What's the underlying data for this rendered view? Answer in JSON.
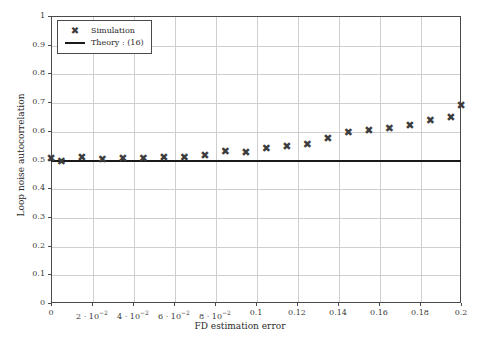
{
  "chart_data": {
    "type": "scatter",
    "title": "",
    "xlabel": "FD estimation error",
    "ylabel": "Loop noise autocorrelation",
    "xlim": [
      0,
      0.2
    ],
    "ylim": [
      0,
      1
    ],
    "grid": true,
    "legend_position": "top-left",
    "xticks": [
      {
        "value": 0,
        "label": "0"
      },
      {
        "value": 0.02,
        "label": "2 · 10",
        "exp": "−2"
      },
      {
        "value": 0.04,
        "label": "4 · 10",
        "exp": "−2"
      },
      {
        "value": 0.06,
        "label": "6 · 10",
        "exp": "−2"
      },
      {
        "value": 0.08,
        "label": "8 · 10",
        "exp": "−2"
      },
      {
        "value": 0.1,
        "label": "0.1",
        "exp": ""
      },
      {
        "value": 0.12,
        "label": "0.12",
        "exp": ""
      },
      {
        "value": 0.14,
        "label": "0.14",
        "exp": ""
      },
      {
        "value": 0.16,
        "label": "0.16",
        "exp": ""
      },
      {
        "value": 0.18,
        "label": "0.18",
        "exp": ""
      },
      {
        "value": 0.2,
        "label": "0.2",
        "exp": ""
      }
    ],
    "yticks": [
      {
        "value": 0,
        "label": "0"
      },
      {
        "value": 0.1,
        "label": "0.1"
      },
      {
        "value": 0.2,
        "label": "0.2"
      },
      {
        "value": 0.3,
        "label": "0.3"
      },
      {
        "value": 0.4,
        "label": "0.4"
      },
      {
        "value": 0.5,
        "label": "0.5"
      },
      {
        "value": 0.6,
        "label": "0.6"
      },
      {
        "value": 0.7,
        "label": "0.7"
      },
      {
        "value": 0.8,
        "label": "0.8"
      },
      {
        "value": 0.9,
        "label": "0.9"
      },
      {
        "value": 1,
        "label": "1"
      }
    ],
    "series": [
      {
        "name": "Simulation",
        "type": "scatter",
        "marker": "✖",
        "color": "#3d3d3d",
        "x": [
          0.0,
          0.005,
          0.015,
          0.025,
          0.035,
          0.045,
          0.055,
          0.065,
          0.075,
          0.085,
          0.095,
          0.105,
          0.115,
          0.125,
          0.135,
          0.145,
          0.155,
          0.165,
          0.175,
          0.185,
          0.195,
          0.2
        ],
        "y": [
          0.502,
          0.494,
          0.506,
          0.5,
          0.502,
          0.503,
          0.506,
          0.508,
          0.515,
          0.528,
          0.523,
          0.539,
          0.546,
          0.554,
          0.574,
          0.594,
          0.6,
          0.608,
          0.617,
          0.637,
          0.648,
          0.689
        ]
      },
      {
        "name": "Theory : (16)",
        "type": "line",
        "color": "#1a1a1a",
        "x": [
          0,
          0.2
        ],
        "y": [
          0.4965,
          0.4965
        ]
      }
    ]
  },
  "legend": {
    "entries": [
      {
        "symbol": "✖",
        "label": "Simulation"
      },
      {
        "symbol": "line",
        "label": "Theory : (16)"
      }
    ]
  }
}
